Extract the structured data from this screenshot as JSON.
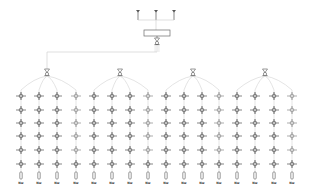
{
  "diagram": {
    "type": "network-topology",
    "colors": {
      "line": "#c9c9c9",
      "node": "#555555",
      "node_light": "#8a8a8a",
      "box_stroke": "#6a6a6a",
      "background": "#ffffff"
    },
    "antennas": [
      {
        "x": 138,
        "y": 10
      },
      {
        "x": 156,
        "y": 10
      },
      {
        "x": 174,
        "y": 10
      }
    ],
    "antenna_bus_y": 20,
    "controller_box": {
      "x": 144,
      "y": 30,
      "w": 26,
      "h": 6
    },
    "root_hub": {
      "x": 157,
      "y": 41
    },
    "trunk_y": 52,
    "group_hubs": [
      {
        "x": 47,
        "y": 72
      },
      {
        "x": 120,
        "y": 72
      },
      {
        "x": 193,
        "y": 72
      },
      {
        "x": 265,
        "y": 72
      }
    ],
    "columns_x": [
      21,
      39,
      57,
      76,
      94,
      112,
      130,
      148,
      166,
      184,
      202,
      219,
      237,
      255,
      274,
      292
    ],
    "rows_y": [
      96,
      110,
      123,
      136,
      150,
      164
    ],
    "end_device_y": 176,
    "label_y": 184,
    "column_labels": [
      "Nw",
      "Nw",
      "Nw",
      "Nw",
      "Nw",
      "Nw",
      "Nw",
      "Nw",
      "Nw",
      "Nw",
      "Nw",
      "Nw",
      "Nw",
      "Nw",
      "Nw",
      "Nw"
    ]
  }
}
